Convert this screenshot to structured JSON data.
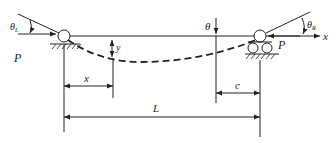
{
  "diagram": {
    "type": "beam-deflection",
    "labels": {
      "theta_left": "θL",
      "theta_right": "θR",
      "theta_mid": "θ",
      "load_left": "P",
      "load_right": "P",
      "axis_x": "x",
      "deflection": "y",
      "dim_x": "x",
      "dim_c": "c",
      "dim_L": "L"
    },
    "supports": [
      {
        "name": "left-pin-support",
        "kind": "pin"
      },
      {
        "name": "right-roller-support",
        "kind": "roller"
      }
    ],
    "colors": {
      "stroke": "#222222",
      "background": "#ffffff"
    }
  }
}
